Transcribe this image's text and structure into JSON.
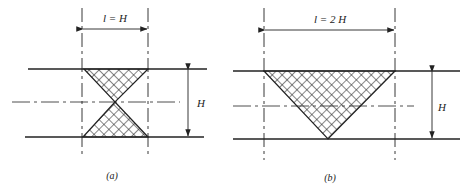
{
  "figure": {
    "panels": [
      {
        "id": "a",
        "caption": "(a)",
        "width_label": "l = H",
        "height_label": "H",
        "shape": "hourglass (two triangles meeting at center)"
      },
      {
        "id": "b",
        "caption": "(b)",
        "width_label": "l = 2 H",
        "height_label": "H",
        "shape": "inverted triangle"
      }
    ],
    "colors": {
      "line": "#222222",
      "hatch": "#222222",
      "background": "#ffffff"
    }
  }
}
